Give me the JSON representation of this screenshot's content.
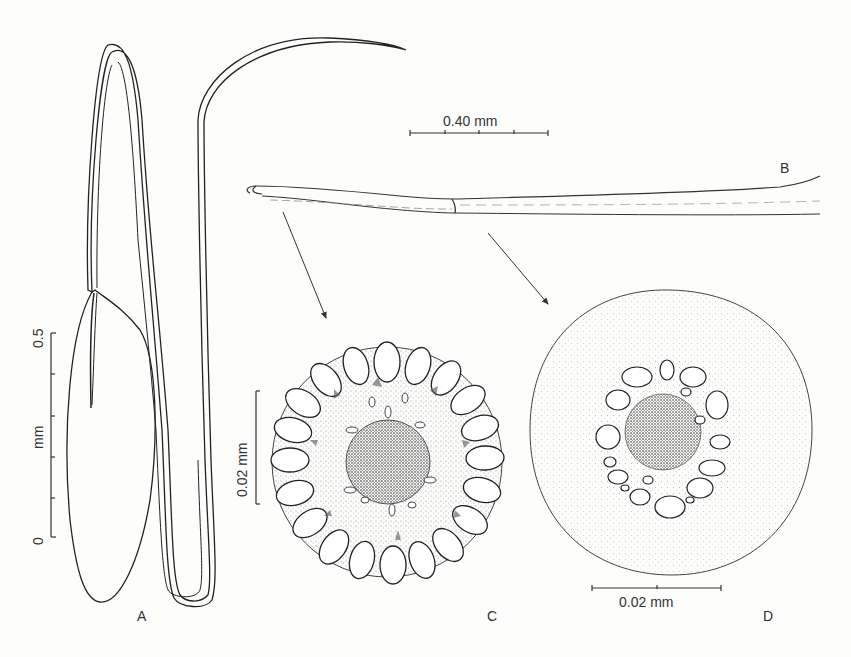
{
  "figure": {
    "panels": [
      {
        "id": "A",
        "label": "A",
        "description": "Elongated leaf-like outline with long hair (A)"
      },
      {
        "id": "B",
        "label": "B",
        "description": "Hair, lateral view (B)"
      },
      {
        "id": "C",
        "label": "C",
        "description": "Cross-section near base of hair (C)"
      },
      {
        "id": "D",
        "label": "D",
        "description": "Cross-section of hair shaft (D)"
      }
    ],
    "scale_bars": {
      "a": {
        "label_top": "0.5",
        "label_unit": "mm",
        "label_bottom": "0"
      },
      "b": {
        "label": "0.40 mm"
      },
      "c": {
        "label": "0.02 mm"
      },
      "d": {
        "label": "0.02 mm"
      }
    }
  }
}
